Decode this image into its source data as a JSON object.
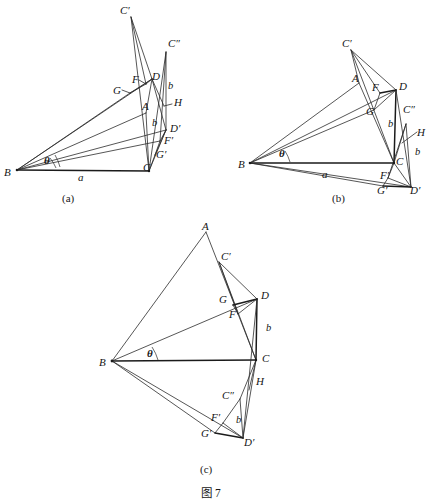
{
  "figure": {
    "caption_label": "图",
    "caption_number": "7",
    "caption_full": "图 7",
    "background_color": "#ffffff",
    "stroke_color": "#2b2b2b",
    "panel_count": 3
  },
  "panels": [
    {
      "id": "a",
      "caption": "(a)",
      "caption_pos": {
        "x": 62,
        "y": 192
      },
      "vertices": {
        "B": {
          "x": 17,
          "y": 170
        },
        "C": {
          "x": 149,
          "y": 171
        },
        "A": {
          "x": 146,
          "y": 113
        },
        "D": {
          "x": 152,
          "y": 79
        },
        "Cp": {
          "x": 131,
          "y": 17
        },
        "Cpp": {
          "x": 166,
          "y": 52
        },
        "F": {
          "x": 146,
          "y": 84
        },
        "G": {
          "x": 130,
          "y": 93
        },
        "H": {
          "x": 164,
          "y": 106
        },
        "Dp": {
          "x": 166,
          "y": 130
        },
        "Fp": {
          "x": 160,
          "y": 141
        },
        "Gp": {
          "x": 155,
          "y": 155
        }
      },
      "labels": [
        {
          "name": "label-C-prime",
          "text": "C′",
          "x": 120,
          "y": 5
        },
        {
          "name": "label-C-dprime",
          "text": "C″",
          "x": 168,
          "y": 38
        },
        {
          "name": "label-D",
          "text": "D",
          "x": 152,
          "y": 71
        },
        {
          "name": "label-F",
          "text": "F",
          "x": 132,
          "y": 74
        },
        {
          "name": "label-G",
          "text": "G",
          "x": 113,
          "y": 85
        },
        {
          "name": "label-b-upper",
          "text": "b",
          "x": 168,
          "y": 81
        },
        {
          "name": "label-H",
          "text": "H",
          "x": 174,
          "y": 97
        },
        {
          "name": "label-A",
          "text": "A",
          "x": 142,
          "y": 101
        },
        {
          "name": "label-b-lower",
          "text": "b",
          "x": 152,
          "y": 118
        },
        {
          "name": "label-D-prime",
          "text": "D′",
          "x": 170,
          "y": 123
        },
        {
          "name": "label-F-prime",
          "text": "F′",
          "x": 164,
          "y": 135
        },
        {
          "name": "label-G-prime",
          "text": "G′",
          "x": 156,
          "y": 149
        },
        {
          "name": "label-B",
          "text": "B",
          "x": 4,
          "y": 167
        },
        {
          "name": "label-a",
          "text": "a",
          "x": 78,
          "y": 172
        },
        {
          "name": "label-theta",
          "text": "θ",
          "x": 44,
          "y": 155
        }
      ]
    },
    {
      "id": "b",
      "caption": "(b)",
      "caption_pos": {
        "x": 332,
        "y": 192
      },
      "vertices": {
        "B": {
          "x": 250,
          "y": 163
        },
        "C": {
          "x": 394,
          "y": 163
        },
        "A": {
          "x": 359,
          "y": 83
        },
        "D": {
          "x": 396,
          "y": 90
        },
        "Cp": {
          "x": 351,
          "y": 50
        },
        "Cpp": {
          "x": 406,
          "y": 124
        },
        "F": {
          "x": 380,
          "y": 93
        },
        "G": {
          "x": 374,
          "y": 110
        },
        "H": {
          "x": 409,
          "y": 139
        },
        "Dp": {
          "x": 411,
          "y": 187
        },
        "Fp": {
          "x": 388,
          "y": 178
        },
        "Gp": {
          "x": 383,
          "y": 186
        }
      },
      "labels": [
        {
          "name": "label-C-prime",
          "text": "C′",
          "x": 342,
          "y": 38
        },
        {
          "name": "label-A",
          "text": "A",
          "x": 352,
          "y": 73
        },
        {
          "name": "label-F",
          "text": "F",
          "x": 372,
          "y": 82
        },
        {
          "name": "label-D",
          "text": "D",
          "x": 399,
          "y": 81
        },
        {
          "name": "label-G",
          "text": "G",
          "x": 366,
          "y": 106
        },
        {
          "name": "label-C-dprime",
          "text": "C″",
          "x": 403,
          "y": 104
        },
        {
          "name": "label-b-upper",
          "text": "b",
          "x": 388,
          "y": 119
        },
        {
          "name": "label-H",
          "text": "H",
          "x": 417,
          "y": 127
        },
        {
          "name": "label-b-lower",
          "text": "b",
          "x": 415,
          "y": 147
        },
        {
          "name": "label-B",
          "text": "B",
          "x": 238,
          "y": 159
        },
        {
          "name": "label-theta",
          "text": "θ",
          "x": 279,
          "y": 148
        },
        {
          "name": "label-a",
          "text": "a",
          "x": 322,
          "y": 169
        },
        {
          "name": "label-F-prime",
          "text": "F′",
          "x": 380,
          "y": 170
        },
        {
          "name": "label-G-prime",
          "text": "G′",
          "x": 377,
          "y": 185
        },
        {
          "name": "label-D-prime",
          "text": "D′",
          "x": 410,
          "y": 185
        }
      ]
    },
    {
      "id": "c",
      "caption": "(c)",
      "caption_pos": {
        "x": 200,
        "y": 463
      },
      "vertices": {
        "B": {
          "x": 112,
          "y": 361
        },
        "C": {
          "x": 256,
          "y": 360
        },
        "A": {
          "x": 206,
          "y": 232
        },
        "D": {
          "x": 257,
          "y": 299
        },
        "Cp": {
          "x": 219,
          "y": 262
        },
        "Cpp": {
          "x": 240,
          "y": 399
        },
        "F": {
          "x": 238,
          "y": 314
        },
        "G": {
          "x": 233,
          "y": 305
        },
        "H": {
          "x": 254,
          "y": 387
        },
        "Dp": {
          "x": 243,
          "y": 438
        },
        "Fp": {
          "x": 223,
          "y": 423
        },
        "Gp": {
          "x": 215,
          "y": 433
        }
      },
      "labels": [
        {
          "name": "label-A",
          "text": "A",
          "x": 202,
          "y": 221
        },
        {
          "name": "label-C-prime",
          "text": "C′",
          "x": 221,
          "y": 251
        },
        {
          "name": "label-G",
          "text": "G",
          "x": 224,
          "y": 297
        },
        {
          "name": "label-D",
          "text": "D",
          "x": 261,
          "y": 290
        },
        {
          "name": "label-F",
          "text": "F",
          "x": 231,
          "y": 311
        },
        {
          "name": "label-b-upper",
          "text": "b",
          "x": 266,
          "y": 323
        },
        {
          "name": "label-B",
          "text": "B",
          "x": 99,
          "y": 357
        },
        {
          "name": "label-theta",
          "text": "θ",
          "x": 147,
          "y": 348
        },
        {
          "name": "label-C",
          "text": "C",
          "x": 262,
          "y": 356
        },
        {
          "name": "label-H",
          "text": "H",
          "x": 256,
          "y": 378
        },
        {
          "name": "label-C-dprime",
          "text": "C″",
          "x": 224,
          "y": 392
        },
        {
          "name": "label-F-prime",
          "text": "F′",
          "x": 213,
          "y": 414
        },
        {
          "name": "label-b-lower",
          "text": "b",
          "x": 236,
          "y": 417
        },
        {
          "name": "label-G-prime",
          "text": "G′",
          "x": 203,
          "y": 429
        },
        {
          "name": "label-D-prime",
          "text": "D′",
          "x": 244,
          "y": 437
        }
      ]
    }
  ],
  "caption_block": {
    "text": "图 7",
    "x": 201,
    "y": 484
  }
}
